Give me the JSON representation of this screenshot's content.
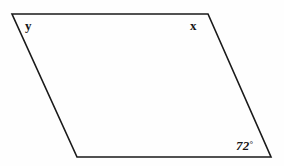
{
  "figure": {
    "name": "parallelogram-angle-diagram",
    "type": "geometry-figure",
    "canvas": {
      "width": 284,
      "height": 166,
      "background": "#fefefe"
    },
    "stroke": {
      "color": "#1a1a1a",
      "width": 1.6
    },
    "shape": {
      "kind": "parallelogram",
      "vertices": [
        {
          "id": "top-left",
          "x": 12,
          "y": 14
        },
        {
          "id": "top-right",
          "x": 208,
          "y": 14
        },
        {
          "id": "bottom-right",
          "x": 271,
          "y": 157
        },
        {
          "id": "bottom-left",
          "x": 77,
          "y": 157
        }
      ],
      "points_attr": "12,14 208,14 271,157 77,157"
    },
    "labels": {
      "top_left_angle": "y",
      "top_right_angle": "x",
      "bottom_right_angle_value": "72",
      "degree_symbol": "°"
    }
  }
}
